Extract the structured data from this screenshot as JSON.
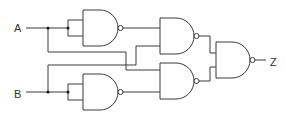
{
  "diagram": {
    "type": "logic-circuit",
    "inputs": [
      {
        "label": "A"
      },
      {
        "label": "B"
      }
    ],
    "output": {
      "label": "Z"
    },
    "gates": [
      {
        "id": "nand1",
        "type": "NAND",
        "inputs": [
          "A",
          "A"
        ]
      },
      {
        "id": "nand2",
        "type": "NAND",
        "inputs": [
          "nand1",
          "B"
        ]
      },
      {
        "id": "nand3",
        "type": "NAND",
        "inputs": [
          "B",
          "B"
        ]
      },
      {
        "id": "nand4",
        "type": "NAND",
        "inputs": [
          "A",
          "nand3"
        ]
      },
      {
        "id": "nand5",
        "type": "NAND",
        "inputs": [
          "nand2",
          "nand4"
        ]
      }
    ],
    "colors": {
      "line": "#3a3a3a",
      "background": "#ffffff"
    }
  }
}
